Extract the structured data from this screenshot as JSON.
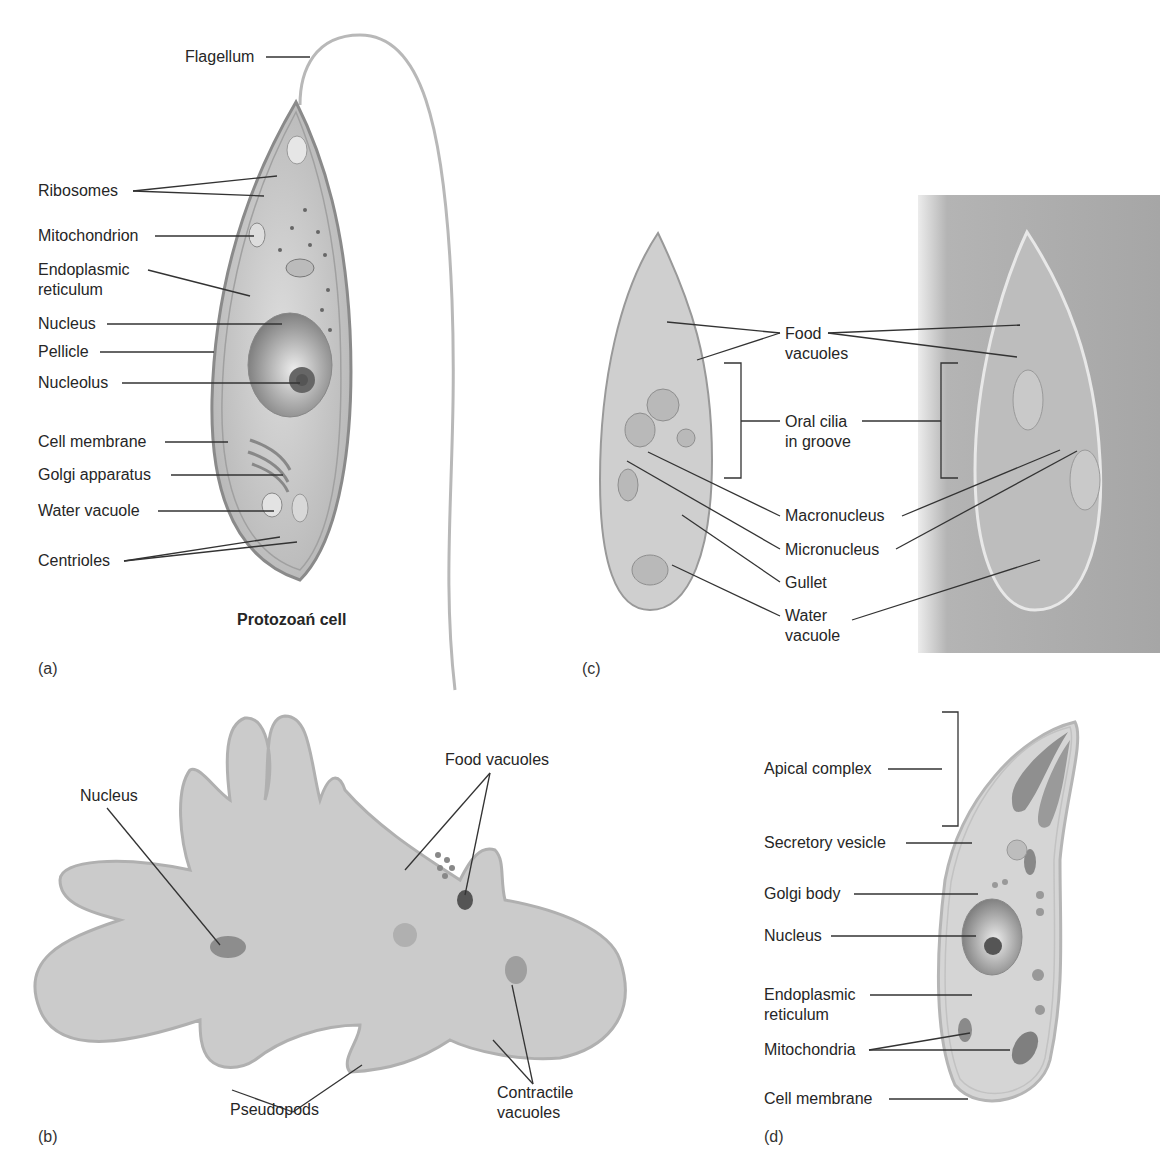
{
  "figure": {
    "panels": [
      {
        "id": "a",
        "panel_label": "(a)",
        "caption": "Protozoan cell",
        "labels": [
          "Flagellum",
          "Ribosomes",
          "Mitochondrion",
          "Endoplasmic reticulum",
          "Nucleus",
          "Pellicle",
          "Nucleolus",
          "Cell membrane",
          "Golgi apparatus",
          "Water vacuole",
          "Centrioles"
        ]
      },
      {
        "id": "b",
        "panel_label": "(b)",
        "labels": [
          "Nucleus",
          "Food vacuoles",
          "Pseudopods",
          "Contractile vacuoles"
        ]
      },
      {
        "id": "c",
        "panel_label": "(c)",
        "labels": [
          "Food vacuoles",
          "Oral cilia in groove",
          "Macronucleus",
          "Micronucleus",
          "Gullet",
          "Water vacuole"
        ]
      },
      {
        "id": "d",
        "panel_label": "(d)",
        "labels": [
          "Apical complex",
          "Secretory vesicle",
          "Golgi body",
          "Nucleus",
          "Endoplasmic reticulum",
          "Mitochondria",
          "Cell membrane"
        ]
      }
    ]
  },
  "a": {
    "flagellum": "Flagellum",
    "ribosomes": "Ribosomes",
    "mitochondrion": "Mitochondrion",
    "er_line1": "Endoplasmic",
    "er_line2": "reticulum",
    "nucleus": "Nucleus",
    "pellicle": "Pellicle",
    "nucleolus": "Nucleolus",
    "cell_membrane": "Cell membrane",
    "golgi": "Golgi apparatus",
    "water_vacuole": "Water vacuole",
    "centrioles": "Centrioles",
    "caption": "Protozoań cell",
    "panel_label": "(a)"
  },
  "b": {
    "nucleus": "Nucleus",
    "food_vacuoles": "Food vacuoles",
    "pseudopods": "Pseudopods",
    "contractile_line1": "Contractile",
    "contractile_line2": "vacuoles",
    "panel_label": "(b)"
  },
  "c": {
    "food_line1": "Food",
    "food_line2": "vacuoles",
    "oral_line1": "Oral cilia",
    "oral_line2": "in groove",
    "macronucleus": "Macronucleus",
    "micronucleus": "Micronucleus",
    "gullet": "Gullet",
    "water_line1": "Water",
    "water_line2": "vacuole",
    "panel_label": "(c)"
  },
  "d": {
    "apical": "Apical complex",
    "secretory": "Secretory vesicle",
    "golgi": "Golgi body",
    "nucleus": "Nucleus",
    "er_line1": "Endoplasmic",
    "er_line2": "reticulum",
    "mitochondria": "Mitochondria",
    "cell_membrane": "Cell membrane",
    "panel_label": "(d)"
  },
  "colors": {
    "cell_fill": "#cfcfcf",
    "cell_edge": "#8a8a8a",
    "photo_bg": "#a9a9a9",
    "leader_line": "#333333"
  }
}
